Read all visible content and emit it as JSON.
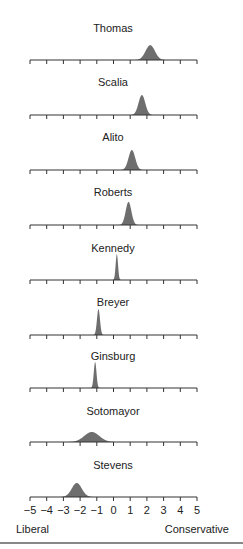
{
  "chart_data": {
    "type": "area",
    "title": "",
    "xlabel_left": "Liberal",
    "xlabel_right": "Conservative",
    "xlim": [
      -5,
      5
    ],
    "x_ticks": [
      -5,
      -4,
      -3,
      -2,
      -1,
      0,
      1,
      2,
      3,
      4,
      5
    ],
    "grid": false,
    "legend": "none",
    "series": [
      {
        "name": "Thomas",
        "peak": 2.2,
        "spread": 0.28
      },
      {
        "name": "Scalia",
        "peak": 1.7,
        "spread": 0.2
      },
      {
        "name": "Alito",
        "peak": 1.1,
        "spread": 0.2
      },
      {
        "name": "Roberts",
        "peak": 0.9,
        "spread": 0.17
      },
      {
        "name": "Kennedy",
        "peak": 0.2,
        "spread": 0.07
      },
      {
        "name": "Breyer",
        "peak": -0.9,
        "spread": 0.09
      },
      {
        "name": "Ginsburg",
        "peak": -1.1,
        "spread": 0.08
      },
      {
        "name": "Sotomayor",
        "peak": -1.3,
        "spread": 0.45
      },
      {
        "name": "Stevens",
        "peak": -2.2,
        "spread": 0.3
      }
    ]
  },
  "colors": {
    "fill": "#6e6e6e",
    "axis": "#333333"
  }
}
